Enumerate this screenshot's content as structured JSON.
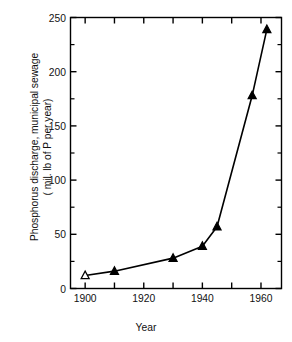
{
  "chart_data": {
    "type": "line",
    "title": "",
    "xlabel": "Year",
    "ylabel_line1": "Phosphorus discharge, municipal sewage",
    "ylabel_line2": "( mil. lb of P per year)",
    "x": [
      1900,
      1910,
      1930,
      1940,
      1945,
      1957,
      1962
    ],
    "values": [
      12,
      16,
      28,
      39,
      57,
      178,
      239
    ],
    "series": [
      {
        "name": "Phosphorus discharge, municipal sewage",
        "x": [
          1900,
          1910,
          1930,
          1940,
          1945,
          1957,
          1962
        ],
        "values": [
          12,
          16,
          28,
          39,
          57,
          178,
          239
        ],
        "marker": "triangle",
        "color": "#000000"
      }
    ],
    "xlim": [
      1895,
      1967
    ],
    "ylim": [
      0,
      250
    ],
    "ytick_labels": [
      "0",
      "50",
      "100",
      "150",
      "200",
      "250"
    ],
    "ytick_values": [
      0,
      50,
      100,
      150,
      200,
      250
    ],
    "yminor_values": [
      25,
      75,
      125,
      175,
      225
    ],
    "xtick_values": [
      1900,
      1910,
      1920,
      1930,
      1940,
      1950,
      1960
    ],
    "xtick_labels": [
      "1900",
      "",
      "1920",
      "",
      "1940",
      "",
      "1960"
    ],
    "xtick_labels_shown": [
      "1900",
      "1920",
      "1940",
      "1960"
    ],
    "grid": false,
    "legend": "none",
    "frame": "box"
  },
  "axes": {
    "y_labels": [
      {
        "text": "250",
        "value": 250
      },
      {
        "text": "200",
        "value": 200
      },
      {
        "text": "150",
        "value": 150
      },
      {
        "text": "100",
        "value": 100
      },
      {
        "text": "50",
        "value": 50
      },
      {
        "text": "0",
        "value": 0
      }
    ],
    "x_labels": [
      {
        "text": "1900",
        "value": 1900
      },
      {
        "text": "1920",
        "value": 1920
      },
      {
        "text": "1940",
        "value": 1940
      },
      {
        "text": "1960",
        "value": 1960
      }
    ]
  },
  "style": {
    "line_color": "#000000",
    "marker_fill": "#000000",
    "axis_color": "#000000",
    "background": "#ffffff"
  }
}
